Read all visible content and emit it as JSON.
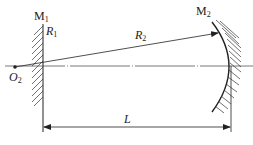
{
  "diagram": {
    "type": "optical-resonator",
    "labels": {
      "mirror1": "M",
      "mirror1_sub": "1",
      "mirror2": "M",
      "mirror2_sub": "2",
      "radius1": "R",
      "radius1_sub": "1",
      "radius2": "R",
      "radius2_sub": "2",
      "center": "O",
      "center_sub": "2",
      "length": "L"
    },
    "colors": {
      "stroke": "#222222",
      "axis": "#555555",
      "background": "#ffffff"
    }
  }
}
